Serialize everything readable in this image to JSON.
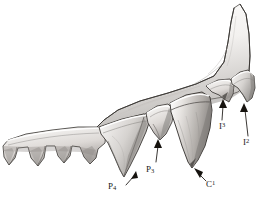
{
  "figure": {
    "kind": "scientific-illustration",
    "technique": "pen-and-ink stipple / graphite shading",
    "background_color": "#ffffff",
    "ink_color": "#1a1a1a",
    "tooth_fill_light": "#f2f0ee",
    "tooth_fill_mid": "#c9c6c3",
    "tooth_fill_dark": "#8d8a88",
    "bone_fill": "#efedea"
  },
  "labels": [
    {
      "id": "p4",
      "text": "P",
      "index": "4",
      "index_kind": "subscript",
      "full": "P4",
      "x": 108,
      "y": 182,
      "arrow": {
        "from_x": 125,
        "from_y": 184,
        "to_x": 136,
        "to_y": 172
      }
    },
    {
      "id": "p3",
      "text": "P",
      "index": "3",
      "index_kind": "subscript",
      "full": "P3",
      "x": 146,
      "y": 165,
      "arrow": {
        "from_x": 155,
        "from_y": 163,
        "to_x": 158,
        "to_y": 140
      }
    },
    {
      "id": "c1",
      "text": "C",
      "index": "1",
      "index_kind": "superscript",
      "full": "C1",
      "x": 206,
      "y": 180,
      "arrow": {
        "from_x": 207,
        "from_y": 180,
        "to_x": 196,
        "to_y": 168
      }
    },
    {
      "id": "i3",
      "text": "I",
      "index": "3",
      "index_kind": "superscript",
      "full": "I3",
      "x": 219,
      "y": 122,
      "arrow": {
        "from_x": 222,
        "from_y": 120,
        "to_x": 223,
        "to_y": 100
      }
    },
    {
      "id": "i2",
      "text": "I",
      "index": "2",
      "index_kind": "superscript",
      "full": "I2",
      "x": 243,
      "y": 138,
      "arrow": {
        "from_x": 247,
        "from_y": 136,
        "to_x": 244,
        "to_y": 104
      }
    }
  ],
  "teeth": [
    {
      "name": "molar-series-left",
      "type": "cheek-teeth",
      "labelled": false
    },
    {
      "name": "fourth-premolar",
      "type": "premolar",
      "labelled": true,
      "label_id": "p4"
    },
    {
      "name": "third-premolar",
      "type": "premolar",
      "labelled": true,
      "label_id": "p3"
    },
    {
      "name": "canine",
      "type": "canine",
      "labelled": true,
      "label_id": "c1"
    },
    {
      "name": "third-incisor",
      "type": "incisor",
      "labelled": true,
      "label_id": "i3"
    },
    {
      "name": "second-incisor",
      "type": "incisor",
      "labelled": true,
      "label_id": "i2"
    }
  ]
}
